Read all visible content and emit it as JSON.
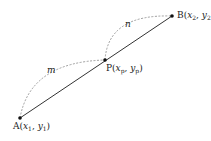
{
  "diagram": {
    "points": {
      "A": {
        "name": "A",
        "x": "x",
        "x_sub": "1",
        "y": "y",
        "y_sub": "1"
      },
      "P": {
        "name": "P",
        "x": "x",
        "x_sub": "p",
        "y": "y",
        "y_sub": "p"
      },
      "B": {
        "name": "B",
        "x": "x",
        "x_sub": "2",
        "y": "y",
        "y_sub": "2"
      }
    },
    "ratio_labels": {
      "m": "m",
      "n": "n"
    },
    "colors": {
      "line": "#333333",
      "dashed_arc": "#888888",
      "point": "#111111",
      "text": "#222222"
    }
  }
}
